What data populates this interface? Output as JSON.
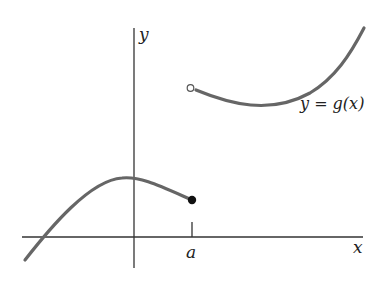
{
  "figure": {
    "axes": {
      "x_label": "x",
      "y_label": "y",
      "tick_label": "a"
    },
    "curve_label": "y = g(x)",
    "left_piece": {
      "endpoint": "closed",
      "endpoint_note": "filled dot at x = a"
    },
    "right_piece": {
      "endpoint": "open",
      "endpoint_note": "open circle at x = a"
    },
    "colors": {
      "axis": "#333333",
      "curve": "#666666",
      "text": "#222222"
    }
  }
}
